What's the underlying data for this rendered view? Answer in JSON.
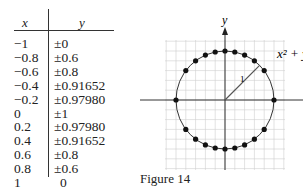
{
  "table": {
    "headers": {
      "x": "x",
      "y": "y"
    },
    "rows": [
      {
        "x": "−1",
        "y": "±0"
      },
      {
        "x": "−0.8",
        "y": "±0.6"
      },
      {
        "x": "−0.6",
        "y": "±0.8"
      },
      {
        "x": "−0.4",
        "y": "±0.91652"
      },
      {
        "x": "−0.2",
        "y": "±0.97980"
      },
      {
        "x": "0",
        "y": "±1"
      },
      {
        "x": "0.2",
        "y": "±0.97980"
      },
      {
        "x": "0.4",
        "y": "±0.91652"
      },
      {
        "x": "0.6",
        "y": "±0.8"
      },
      {
        "x": "0.8",
        "y": "±0.6"
      },
      {
        "x": "1",
        "y": "0"
      }
    ]
  },
  "figure": {
    "axis_y_label": "y",
    "equation_label": "x² + y²",
    "radius_label": "1",
    "caption": "Figure 14"
  }
}
